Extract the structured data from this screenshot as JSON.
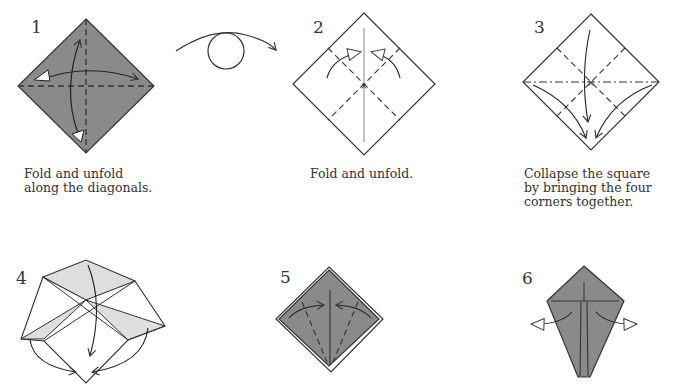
{
  "colors": {
    "paper_colored": "#8a8a8a",
    "paper_white": "#ffffff",
    "paper_light_shade": "#dedede",
    "line": "#3a3a3a",
    "valley_fold_line": "#3a3a3a",
    "center_crease": "#9a9a9a"
  },
  "steps": [
    {
      "number": "1",
      "caption": "Fold and unfold\nalong the diagonals.",
      "symbols": [
        "valley-fold-lines",
        "fold-unfold-arrows"
      ]
    },
    {
      "number": "",
      "caption": "",
      "symbols": [
        "turn-over-arrow"
      ]
    },
    {
      "number": "2",
      "caption": "Fold and unfold.",
      "symbols": [
        "valley-fold-lines",
        "center-crease",
        "fold-unfold-arrows"
      ]
    },
    {
      "number": "3",
      "caption": "Collapse the square\nby bringing the four\ncorners together.",
      "symbols": [
        "mountain-fold-line",
        "valley-fold-lines",
        "collapse-arrows"
      ]
    },
    {
      "number": "4",
      "caption": "",
      "symbols": [
        "collapse-in-progress",
        "push-arrows"
      ]
    },
    {
      "number": "5",
      "caption": "",
      "symbols": [
        "valley-fold-lines",
        "fold-arrows"
      ]
    },
    {
      "number": "6",
      "caption": "",
      "symbols": [
        "unfold-arrows"
      ]
    }
  ]
}
